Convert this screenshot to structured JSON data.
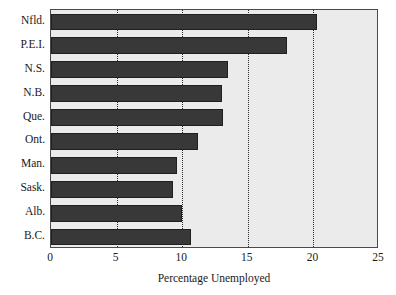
{
  "chart_data": {
    "type": "bar",
    "orientation": "horizontal",
    "title": "",
    "subtitle": "",
    "xlabel": "Percentage Unemployed",
    "ylabel": "",
    "categories": [
      "Nfld.",
      "P.E.I.",
      "N.S.",
      "N.B.",
      "Que.",
      "Ont.",
      "Man.",
      "Sask.",
      "Alb.",
      "B.C."
    ],
    "values": [
      20.3,
      18.0,
      13.5,
      13.0,
      13.1,
      11.2,
      9.6,
      9.3,
      10.0,
      10.7
    ],
    "xlim": [
      0,
      25
    ],
    "xticks": [
      0,
      5,
      10,
      15,
      20,
      25
    ],
    "xtick_labels": [
      "0",
      "5",
      "10",
      "15",
      "20",
      "25"
    ],
    "grid": true,
    "grid_axis": "x",
    "grid_style": "dotted",
    "legend": false,
    "legend_position": "none",
    "colors": {
      "bar_fill": "#383838",
      "bar_edge": "#202020",
      "plot_background": "#ebebeb",
      "frame": "#4a4a4a",
      "gridline": "#2b2b2b",
      "text": "#1a1a1a",
      "page_background": "#ffffff"
    }
  }
}
